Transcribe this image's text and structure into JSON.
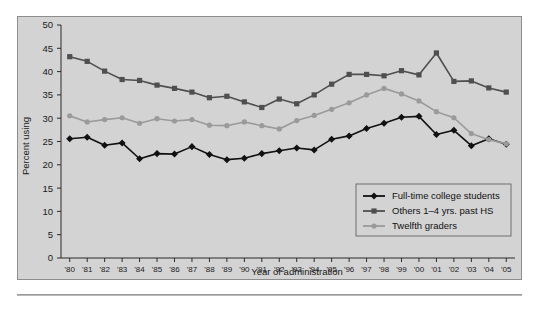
{
  "figure": {
    "background_color": "#ffffff",
    "panel_color": "#d3d3d3",
    "panel_border_color": "#8d8d8d"
  },
  "chart_data": {
    "type": "line",
    "title": "",
    "subtitle": "",
    "xlabel": "Year of administration",
    "ylabel": "Percent using",
    "xlim": [
      1980,
      2005
    ],
    "ylim": [
      0,
      50
    ],
    "ytick_step": 5,
    "yticks": [
      0,
      5,
      10,
      15,
      20,
      25,
      30,
      35,
      40,
      45,
      50
    ],
    "ytick_labels": [
      "0",
      "5",
      "10",
      "15",
      "20",
      "25",
      "30",
      "35",
      "40",
      "45",
      "50"
    ],
    "x": [
      1980,
      1981,
      1982,
      1983,
      1984,
      1985,
      1986,
      1987,
      1988,
      1989,
      1990,
      1991,
      1992,
      1993,
      1994,
      1995,
      1996,
      1997,
      1998,
      1999,
      2000,
      2001,
      2002,
      2003,
      2004,
      2005
    ],
    "categories": [
      "'80",
      "'81",
      "'82",
      "'83",
      "'84",
      "'85",
      "'86",
      "'87",
      "'88",
      "'89",
      "'90",
      "'91",
      "'92",
      "'93",
      "'94",
      "'95",
      "'96",
      "'97",
      "'98",
      "'99",
      "'00",
      "'01",
      "'02",
      "'03",
      "'04",
      "'05"
    ],
    "grid": false,
    "legend_position": "lower right",
    "series": [
      {
        "name": "Full-time college students",
        "color": "#111111",
        "marker": "diamond",
        "values": [
          25.6,
          25.9,
          24.2,
          24.7,
          21.3,
          22.4,
          22.3,
          23.9,
          22.2,
          21.1,
          21.4,
          22.4,
          23.0,
          23.6,
          23.2,
          25.5,
          26.2,
          27.8,
          28.9,
          30.2,
          30.4,
          26.5,
          27.4,
          24.1,
          25.6,
          24.4
        ]
      },
      {
        "name": "Others 1–4 yrs. past HS",
        "color": "#4f4f4f",
        "marker": "square",
        "values": [
          43.2,
          42.2,
          40.1,
          38.3,
          38.1,
          37.1,
          36.4,
          35.6,
          34.4,
          34.7,
          33.5,
          32.3,
          34.1,
          33.1,
          35.0,
          37.3,
          39.4,
          39.4,
          39.1,
          40.2,
          39.3,
          44.0,
          37.9,
          38.0,
          36.5,
          35.6
        ]
      },
      {
        "name": "Twelfth graders",
        "color": "#9a9a9a",
        "marker": "circle",
        "values": [
          30.5,
          29.2,
          29.7,
          30.1,
          28.9,
          29.9,
          29.4,
          29.7,
          28.5,
          28.4,
          29.2,
          28.4,
          27.7,
          29.5,
          30.6,
          31.9,
          33.3,
          35.0,
          36.4,
          35.2,
          33.7,
          31.4,
          30.1,
          26.7,
          25.4,
          24.5
        ]
      }
    ]
  },
  "legend": {
    "items": [
      {
        "label": "Full-time college students",
        "color": "#111111",
        "marker": "diamond"
      },
      {
        "label": "Others 1–4 yrs. past HS",
        "color": "#4f4f4f",
        "marker": "square"
      },
      {
        "label": "Twelfth graders",
        "color": "#9a9a9a",
        "marker": "circle"
      }
    ]
  }
}
